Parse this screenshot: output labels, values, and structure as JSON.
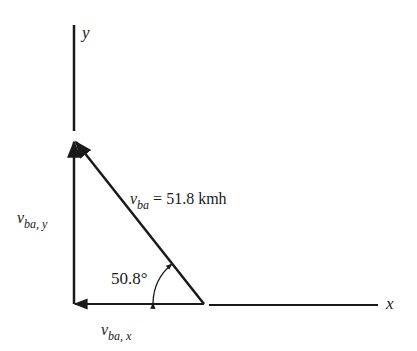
{
  "diagram": {
    "axes": {
      "x_label": "x",
      "y_label": "y"
    },
    "vectors": {
      "resultant": {
        "symbol": "v",
        "subscript": "ba",
        "equals": "= 51.8 kmh",
        "magnitude": 51.8,
        "unit": "kmh"
      },
      "y_component": {
        "symbol": "v",
        "subscript": "ba, y"
      },
      "x_component": {
        "symbol": "v",
        "subscript": "ba, x"
      }
    },
    "angle": {
      "label": "50.8°",
      "degrees": 50.8
    }
  }
}
